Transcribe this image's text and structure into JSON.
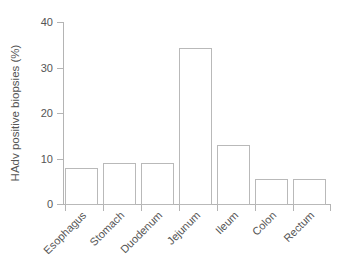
{
  "chart_data": {
    "type": "bar",
    "title": "",
    "subtitle": "",
    "xlabel": "",
    "ylabel": "HAdv positive biopsies (%)",
    "categories": [
      "Esophagus",
      "Stomach",
      "Duodenum",
      "Jejunum",
      "Ileum",
      "Colon",
      "Rectum"
    ],
    "values": [
      3.3,
      7.9,
      9.0,
      9.0,
      34.3,
      13.0,
      5.5
    ],
    "ylim": [
      0,
      40
    ],
    "yticks": [
      0,
      10,
      20,
      30,
      40
    ],
    "ytick_labels": [
      "0",
      "10",
      "20",
      "30",
      "40"
    ],
    "grid": false,
    "legend": null,
    "legend_position": "none",
    "bar_fill": "#ffffff",
    "bar_edge": "#b9b9b9",
    "axis_color": "#b4b4b4",
    "text_color": "#555555",
    "xtick_label_rotation": 45,
    "annotations": []
  }
}
